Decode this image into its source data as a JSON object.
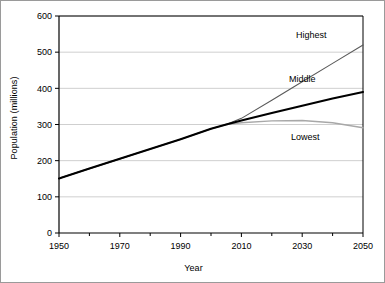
{
  "chart_data": {
    "type": "line",
    "title": "",
    "xlabel": "Year",
    "ylabel": "Population (millions)",
    "xlim": [
      1950,
      2050
    ],
    "ylim": [
      0,
      600
    ],
    "ytick_values": [
      0,
      100,
      200,
      300,
      400,
      500,
      600
    ],
    "ytick_labels": [
      "0",
      "100",
      "200",
      "300",
      "400",
      "500",
      "600"
    ],
    "xtick_values": [
      1950,
      1970,
      1990,
      2010,
      2030,
      2050
    ],
    "xtick_labels": [
      "1950",
      "1970",
      "1990",
      "2010",
      "2030",
      "2050"
    ],
    "xminor_ticks": [
      1960,
      1980,
      2000,
      2020,
      2040
    ],
    "grid": "horizontal",
    "legend_position": "inline-right",
    "series": [
      {
        "name": "Highest",
        "color": "#5a5a5a",
        "width": 1.1,
        "label_x": 2033,
        "label_y": 540,
        "x": [
          1950,
          1960,
          1970,
          1980,
          1990,
          2000,
          2005,
          2010,
          2020,
          2030,
          2040,
          2050
        ],
        "values": [
          151,
          178,
          205,
          232,
          259,
          288,
          300,
          317,
          367,
          418,
          469,
          520
        ]
      },
      {
        "name": "Middle",
        "color": "#000000",
        "width": 2.1,
        "label_x": 2030,
        "label_y": 418,
        "x": [
          1950,
          1960,
          1970,
          1980,
          1990,
          2000,
          2005,
          2010,
          2020,
          2030,
          2040,
          2050
        ],
        "values": [
          151,
          178,
          205,
          232,
          259,
          288,
          300,
          311,
          332,
          352,
          372,
          390
        ]
      },
      {
        "name": "Lowest",
        "color": "#a8a8a8",
        "width": 1.4,
        "label_x": 2031,
        "label_y": 258,
        "x": [
          1950,
          1960,
          1970,
          1980,
          1990,
          2000,
          2005,
          2010,
          2020,
          2030,
          2040,
          2050
        ],
        "values": [
          151,
          178,
          205,
          232,
          259,
          288,
          300,
          305,
          310,
          311,
          305,
          291
        ]
      }
    ]
  },
  "colors": {
    "axis": "#000000",
    "grid": "#cfcfcf",
    "frame": "#9a9a9a",
    "background": "#ffffff"
  }
}
